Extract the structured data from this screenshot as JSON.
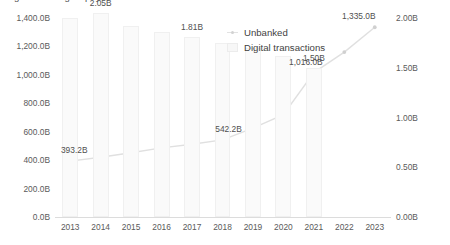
{
  "chart_data": {
    "type": "bar",
    "title": "Figure 4.3: Digital payment inclusion and unbanked individuals worldwide",
    "subtitle": "",
    "xlabel": "",
    "ylabel": "",
    "grid": false,
    "legend_position": "inside-top-right",
    "categories": [
      "2013",
      "2014",
      "2015",
      "2016",
      "2017",
      "2018",
      "2019",
      "2020",
      "2021",
      "2022",
      "2023"
    ],
    "axes": {
      "left": {
        "label": "",
        "ylim": [
          0,
          1400
        ],
        "ticks": [
          0,
          200,
          400,
          600,
          800,
          1000,
          1200,
          1400
        ],
        "tick_labels": [
          "0.0B",
          "200.0B",
          "400.0B",
          "600.0B",
          "800.0B",
          "1,000.0B",
          "1,200.0B",
          "1,400.0B"
        ],
        "unit": "B"
      },
      "right": {
        "label": "",
        "ylim": [
          0,
          2.0
        ],
        "ticks": [
          0,
          0.5,
          1.0,
          1.5,
          2.0
        ],
        "tick_labels": [
          "0.00B",
          "0.50B",
          "1.00B",
          "1.50B",
          "2.00B"
        ],
        "unit": "B"
      }
    },
    "series": [
      {
        "name": "Digital transactions",
        "type": "bar",
        "axis": "right",
        "color": "#fafafa",
        "values": [
          2.0,
          2.05,
          1.92,
          1.86,
          1.81,
          1.75,
          1.7,
          1.62,
          1.5,
          0.0,
          0.0
        ],
        "labels": [
          "",
          "2.05B",
          "",
          "",
          "1.81B",
          "",
          "",
          "",
          "1.50B",
          "",
          ""
        ]
      },
      {
        "name": "Unbanked",
        "type": "line",
        "axis": "left",
        "color": "#e0e0e0",
        "marker_color": "#d0d0d0",
        "values": [
          393.2,
          420.0,
          452.0,
          486.0,
          512.0,
          542.2,
          625.0,
          720.0,
          1016.0,
          1160.0,
          1335.0
        ],
        "labels": [
          "393.2B",
          "",
          "",
          "",
          "",
          "542.2B",
          "",
          "",
          "1,016.0B",
          "",
          "1,335.0B"
        ]
      }
    ],
    "annotations": [
      {
        "text": "2.05B",
        "category": "2014",
        "series": "Digital transactions"
      },
      {
        "text": "1.81B",
        "category": "2017",
        "series": "Digital transactions"
      },
      {
        "text": "1.50B",
        "category": "2021",
        "series": "Digital transactions"
      },
      {
        "text": "393.2B",
        "category": "2013",
        "series": "Unbanked"
      },
      {
        "text": "542.2B",
        "category": "2018",
        "series": "Unbanked"
      },
      {
        "text": "1,016.0B",
        "category": "2021",
        "series": "Unbanked"
      },
      {
        "text": "1,335.0B",
        "category": "2023",
        "series": "Unbanked"
      }
    ],
    "legend": [
      {
        "label": "Unbanked",
        "marker": "line"
      },
      {
        "label": "Digital transactions",
        "marker": "bar"
      }
    ]
  }
}
